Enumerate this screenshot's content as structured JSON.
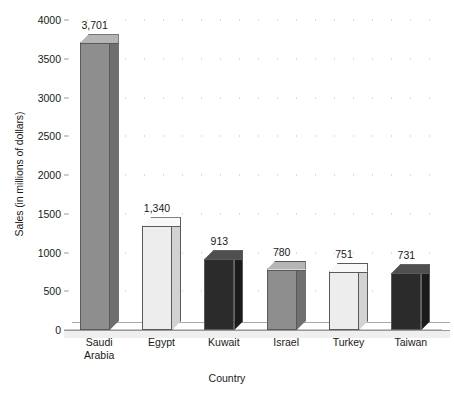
{
  "chart_data": {
    "type": "bar",
    "title": "",
    "xlabel": "Country",
    "ylabel": "Sales (in millions of dollars)",
    "categories": [
      "Saudi\nArabia",
      "Egypt",
      "Kuwait",
      "Israel",
      "Turkey",
      "Taiwan"
    ],
    "values": [
      3701,
      1340,
      913,
      780,
      751,
      731
    ],
    "value_labels": [
      "3,701",
      "1,340",
      "913",
      "780",
      "751",
      "731"
    ],
    "ylim": [
      0,
      4000
    ],
    "ytick_values": [
      0,
      500,
      1000,
      1500,
      2000,
      2500,
      3000,
      3500,
      4000
    ],
    "ytick_labels": [
      "0",
      "500",
      "1000",
      "1500",
      "2000",
      "2500",
      "3000",
      "3500",
      "4000"
    ],
    "grid": "horizontal-dotted",
    "legend": "none",
    "bar_colors": [
      "#8e8e8e",
      "#ededed",
      "#2b2b2b",
      "#8e8e8e",
      "#ededed",
      "#2b2b2b"
    ],
    "bar_top_colors": [
      "#b5b5b5",
      "#f8f8f8",
      "#4f4f4f",
      "#b5b5b5",
      "#f8f8f8",
      "#4f4f4f"
    ],
    "bar_side_colors": [
      "#6f6f6f",
      "#d2d2d2",
      "#1b1b1b",
      "#6f6f6f",
      "#d2d2d2",
      "#1b1b1b"
    ],
    "style": "3d-bars",
    "axis_color": "#8d8d8d",
    "grid_color": "#b9b9b9",
    "text_color": "#1a1a1a",
    "background": "#ffffff"
  }
}
